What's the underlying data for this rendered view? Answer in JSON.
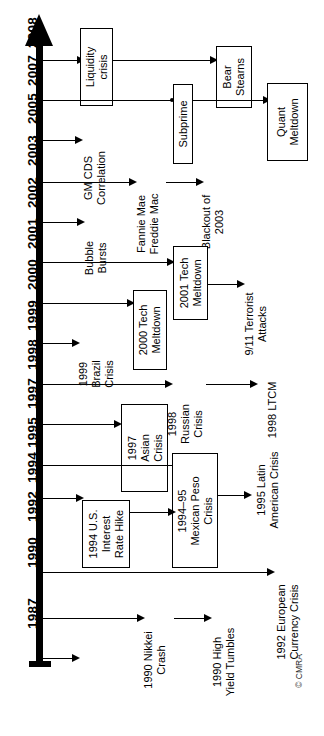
{
  "figure": {
    "credit": "© CMRA",
    "orientation": "vertical-axis-rotated-labels",
    "axis_direction": "1987 at bottom → 2008 at top"
  },
  "axis": {
    "name": "year-axis",
    "years": [
      {
        "label": "2008",
        "y": 60
      },
      {
        "label": "2007",
        "y": 100
      },
      {
        "label": "2005",
        "y": 140
      },
      {
        "label": "2003",
        "y": 182
      },
      {
        "label": "2002",
        "y": 222
      },
      {
        "label": "2001",
        "y": 262
      },
      {
        "label": "2000",
        "y": 303
      },
      {
        "label": "1999",
        "y": 343
      },
      {
        "label": "1998",
        "y": 384
      },
      {
        "label": "1997",
        "y": 424
      },
      {
        "label": "1995",
        "y": 465
      },
      {
        "label": "1994",
        "y": 498
      },
      {
        "label": "1992",
        "y": 535
      },
      {
        "label": "1990",
        "y": 580
      },
      {
        "label": "1987",
        "y": 640
      }
    ]
  },
  "boxes": [
    {
      "name": "liquidity-crisis-box",
      "text": "Liquidity\ncrisis"
    },
    {
      "name": "bear-stearns-box",
      "text": "Bear\nStearns"
    },
    {
      "name": "subprime-box",
      "text": "Subprime"
    },
    {
      "name": "quant-meltdown-box",
      "text": "Quant\nMeltdown"
    },
    {
      "name": "tech-meltdown-2001-box",
      "text": "2001 Tech\nMeltdown"
    },
    {
      "name": "tech-meltdown-2000-box",
      "text": "2000 Tech\nMeltdown"
    },
    {
      "name": "asian-crisis-1997-box",
      "text": "1997\nAsian\nCrisis"
    },
    {
      "name": "mexican-peso-crisis-box",
      "text": "1994–95\nMexican Peso\nCrisis"
    },
    {
      "name": "us-interest-rate-hike-box",
      "text": "1994 U.S.\nInterest\nRate Hike"
    }
  ],
  "labels": [
    {
      "name": "gm-cds-correlation-label",
      "text": "GM CDS\nCorrelation"
    },
    {
      "name": "fannie-freddie-label",
      "text": "Fannie Mae\nFreddie Mac"
    },
    {
      "name": "blackout-2003-label",
      "text": "Blackout of\n2003"
    },
    {
      "name": "bubble-bursts-label",
      "text": "Bubble\nBursts"
    },
    {
      "name": "terrorist-attacks-label",
      "text": "9/11 Terrorist\nAttacks"
    },
    {
      "name": "brazil-crisis-1999-label",
      "text": "1999\nBrazil\nCrisis"
    },
    {
      "name": "russian-crisis-1998-label",
      "text": "1998\nRussian\nCrisis"
    },
    {
      "name": "ltcm-1998-label",
      "text": "1998 LTCM"
    },
    {
      "name": "latin-american-crisis-label",
      "text": "1995 Latin\nAmerican Crisis"
    },
    {
      "name": "european-currency-label",
      "text": "1992 European\nCurrency Crisis"
    },
    {
      "name": "nikkei-crash-1990-label",
      "text": "1990 Nikkei\nCrash"
    },
    {
      "name": "high-yield-tumbles-label",
      "text": "1990 High\nYield Tumbles"
    }
  ],
  "chart_data": {
    "type": "diagram",
    "xlabel": "",
    "ylabel": "Year",
    "axis_ticks": [
      "1987",
      "1990",
      "1992",
      "1994",
      "1995",
      "1997",
      "1998",
      "1999",
      "2000",
      "2001",
      "2002",
      "2003",
      "2005",
      "2007",
      "2008"
    ],
    "events": [
      {
        "year": "2008",
        "chain": [
          "Liquidity crisis",
          "Bear Stearns"
        ]
      },
      {
        "year": "2007",
        "chain": [
          "Subprime",
          "Quant Meltdown"
        ]
      },
      {
        "year": "2005",
        "chain": [
          "GM CDS Correlation"
        ]
      },
      {
        "year": "2003",
        "chain": [
          "Fannie Mae Freddie Mac",
          "Blackout of 2003"
        ]
      },
      {
        "year": "2002",
        "chain": [
          "Bubble Bursts"
        ]
      },
      {
        "year": "2001",
        "chain": [
          "2001 Tech Meltdown",
          "9/11 Terrorist Attacks"
        ]
      },
      {
        "year": "2000",
        "chain": [
          "2000 Tech Meltdown",
          "2001 Tech Meltdown"
        ]
      },
      {
        "year": "1999",
        "chain": [
          "1999 Brazil Crisis"
        ]
      },
      {
        "year": "1998",
        "chain": [
          "1998 Russian Crisis",
          "1998 LTCM"
        ]
      },
      {
        "year": "1997",
        "chain": [
          "1997 Asian Crisis",
          "1998 Russian Crisis"
        ]
      },
      {
        "year": "1995",
        "chain": [
          "1994–95 Mexican Peso Crisis",
          "1995 Latin American Crisis"
        ]
      },
      {
        "year": "1994",
        "chain": [
          "1994 U.S. Interest Rate Hike",
          "1994–95 Mexican Peso Crisis"
        ]
      },
      {
        "year": "1992",
        "chain": [
          "1992 European Currency Crisis"
        ]
      },
      {
        "year": "1990",
        "chain": [
          "1990 Nikkei Crash",
          "1990 High Yield Tumbles"
        ]
      },
      {
        "year": "1987",
        "chain": [
          ""
        ]
      }
    ]
  }
}
